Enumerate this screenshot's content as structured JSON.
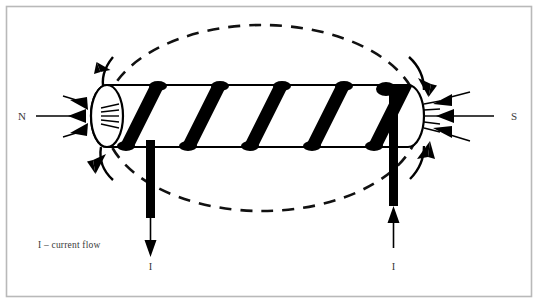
{
  "figure": {
    "background_color": "#ffffff",
    "border_color": "#b9b9b9",
    "ink_color": "#000000",
    "text_color": "#3a3a3a",
    "width": 538,
    "height": 303
  },
  "labels": {
    "north_pole": "N",
    "south_pole": "S",
    "current_left": "I",
    "current_right": "I",
    "legend": "I – current flow"
  },
  "diagram": {
    "solenoid": {
      "description": "horizontal cylindrical core with rounded ends wrapped by coil windings",
      "winding_count": 5,
      "winding_color": "#000000",
      "body_fill": "#ffffff",
      "outline_color": "#000000"
    },
    "field_lines": {
      "style": "dashed",
      "shape": "ellipse",
      "dash_pattern": "12 9",
      "stroke_width": 2.6,
      "arrow_count": 4,
      "arrow_directions": [
        "up-left",
        "down-right",
        "down-left",
        "up-right"
      ]
    },
    "pole_arrows": {
      "north_count": 3,
      "north_direction": "outward-left",
      "south_count": 3,
      "south_direction": "inward-left"
    },
    "leads": {
      "left": {
        "name": "left-lead",
        "current_direction": "down",
        "label": "I"
      },
      "right": {
        "name": "right-lead",
        "current_direction": "up",
        "label": "I"
      }
    }
  }
}
